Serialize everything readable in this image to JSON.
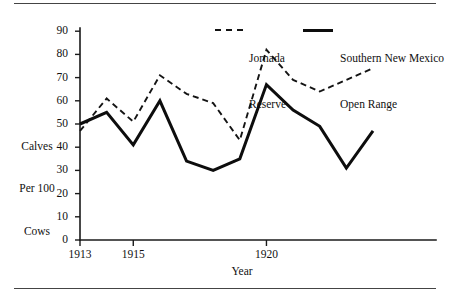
{
  "figure": {
    "ylabel_lines": [
      "Calves",
      "Per 100",
      "Cows"
    ],
    "xlabel": "Year"
  },
  "legend": [
    {
      "label_line1": "Jornada",
      "label_line2": "Reserve",
      "style": "dashed",
      "swatch_name": "legend-dashed-swatch"
    },
    {
      "label_line1": "Southern New Mexico",
      "label_line2": "Open Range",
      "style": "solid",
      "swatch_name": "legend-solid-swatch"
    }
  ],
  "axes": {
    "y_ticks": [
      "0",
      "10",
      "20",
      "30",
      "40",
      "50",
      "60",
      "70",
      "80",
      "90"
    ],
    "x_ticks": [
      "1913",
      "1915",
      "1920"
    ]
  },
  "chart_data": {
    "type": "line",
    "title": "",
    "xlabel": "Year",
    "ylabel": "Calves Per 100 Cows",
    "x": [
      1913,
      1914,
      1915,
      1916,
      1917,
      1918,
      1919,
      1920,
      1921,
      1922,
      1923,
      1924
    ],
    "xlim": [
      1913,
      1924
    ],
    "ylim": [
      0,
      95
    ],
    "y_ticks": [
      0,
      10,
      20,
      30,
      40,
      50,
      60,
      70,
      80,
      90
    ],
    "x_ticks": [
      1913,
      1915,
      1920
    ],
    "grid": false,
    "legend_position": "top-center",
    "series": [
      {
        "name": "Jornada Reserve",
        "style": "dashed",
        "color": "#141414",
        "values": [
          47,
          61,
          51,
          71,
          63,
          59,
          43,
          82,
          69,
          64,
          69,
          74
        ]
      },
      {
        "name": "Southern New Mexico Open Range",
        "style": "solid",
        "color": "#0d0d0d",
        "values": [
          50,
          55,
          41,
          60,
          34,
          30,
          35,
          67,
          56,
          49,
          31,
          47
        ]
      }
    ]
  }
}
